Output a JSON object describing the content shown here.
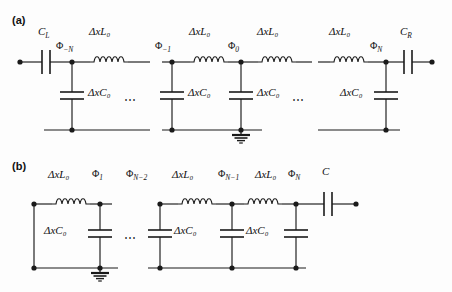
{
  "figure": {
    "type": "circuit-diagram",
    "panels": [
      {
        "id": "a",
        "label": "(a)",
        "description": "Transmission line resonator lumped-element model with coupling capacitors at both ends",
        "series_capacitors": [
          {
            "name": "C_L",
            "label_html": "C<sub>L</sub>",
            "position": "left-end"
          },
          {
            "name": "C_R",
            "label_html": "C<sub>R</sub>",
            "position": "right-end"
          }
        ],
        "node_labels": [
          {
            "name": "phi-minus-N",
            "label_html": "&Phi;<sub>&minus;N</sub>"
          },
          {
            "name": "phi-minus-1",
            "label_html": "&Phi;<sub>&minus;1</sub>"
          },
          {
            "name": "phi-0",
            "label_html": "&Phi;<sub>0</sub>"
          },
          {
            "name": "phi-N",
            "label_html": "&Phi;<sub>N</sub>"
          }
        ],
        "inductor_labels": [
          "ΔxL₀",
          "ΔxL₀",
          "ΔxL₀",
          "ΔxL₀"
        ],
        "capacitor_labels": [
          "ΔxC₀",
          "ΔxC₀",
          "ΔxC₀",
          "ΔxC₀"
        ],
        "ellipses": [
          "⋯",
          "⋯"
        ],
        "ground_node": "phi-0-bottom"
      },
      {
        "id": "b",
        "label": "(b)",
        "description": "Lumped-element ladder with shorted left end and coupling capacitor C at the right end",
        "series_capacitors": [
          {
            "name": "C",
            "label_html": "C",
            "position": "right-end"
          }
        ],
        "node_labels": [
          {
            "name": "phi-1",
            "label_html": "&Phi;<sub>1</sub>"
          },
          {
            "name": "phi-N-minus-2",
            "label_html": "&Phi;<sub>N&minus;2</sub>"
          },
          {
            "name": "phi-N-minus-1",
            "label_html": "&Phi;<sub>N&minus;1</sub>"
          },
          {
            "name": "phi-N",
            "label_html": "&Phi;<sub>N</sub>"
          }
        ],
        "inductor_labels": [
          "ΔxL₀",
          "ΔxL₀",
          "ΔxL₀"
        ],
        "capacitor_labels": [
          "ΔxC₀",
          "ΔxC₀",
          "ΔxC₀"
        ],
        "ellipses": [
          "⋯"
        ],
        "ground_node": "phi-1-bottom"
      }
    ],
    "text": {
      "panel_a": "(a)",
      "panel_b": "(b)",
      "dxL0": "ΔxL₀",
      "dxC0": "ΔxC₀",
      "ellipsis": "⋯",
      "CL": "C",
      "CL_sub": "L",
      "CR": "C",
      "CR_sub": "R",
      "C": "C",
      "phi": "Φ",
      "sub_minusN": "−N",
      "sub_minus1": "−1",
      "sub_0": "0",
      "sub_N": "N",
      "sub_1": "1",
      "sub_Nminus2": "N−2",
      "sub_Nminus1": "N−1"
    },
    "colors": {
      "wire": "#1a1a1a",
      "background": "#fdfdfd",
      "text": "#111111"
    }
  }
}
